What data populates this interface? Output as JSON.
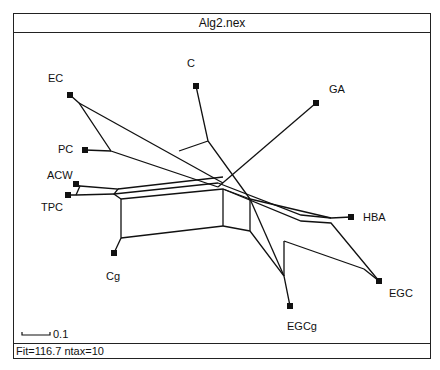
{
  "window": {
    "title": "Alg2.nex"
  },
  "status": {
    "text": "Fit=116.7 ntax=10"
  },
  "scale_bar": {
    "label": "0.1"
  },
  "taxa": [
    {
      "name": "EC"
    },
    {
      "name": "C"
    },
    {
      "name": "GA"
    },
    {
      "name": "PC"
    },
    {
      "name": "ACW"
    },
    {
      "name": "TPC"
    },
    {
      "name": "Cg"
    },
    {
      "name": "HBA"
    },
    {
      "name": "EGC"
    },
    {
      "name": "EGCg"
    }
  ]
}
